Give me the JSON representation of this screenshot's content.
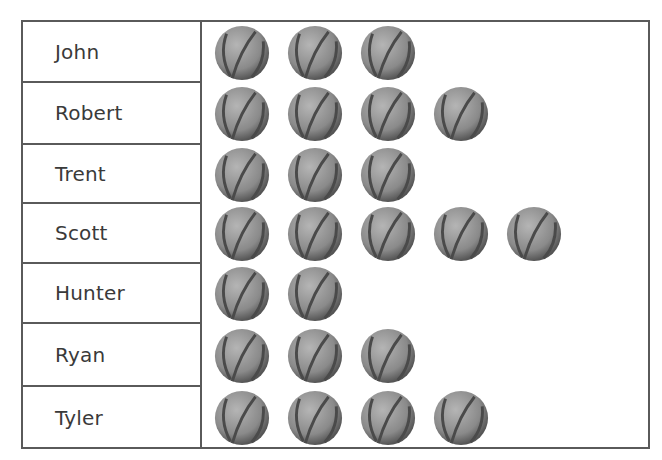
{
  "chart_data": {
    "type": "pictograph",
    "title": "",
    "icon": "basketball-icon",
    "categories": [
      "John",
      "Robert",
      "Trent",
      "Scott",
      "Hunter",
      "Ryan",
      "Tyler"
    ],
    "values": [
      3,
      4,
      3,
      5,
      2,
      3,
      4
    ]
  },
  "rows": [
    {
      "name": "John",
      "count": 3
    },
    {
      "name": "Robert",
      "count": 4
    },
    {
      "name": "Trent",
      "count": 3
    },
    {
      "name": "Scott",
      "count": 5
    },
    {
      "name": "Hunter",
      "count": 2
    },
    {
      "name": "Ryan",
      "count": 3
    },
    {
      "name": "Tyler",
      "count": 4
    }
  ],
  "colors": {
    "ball": "#8a8a8a",
    "ball_dark": "#555555",
    "seam": "#4a4a4a",
    "border": "#5a5a5a",
    "text": "#3a3a3a"
  }
}
